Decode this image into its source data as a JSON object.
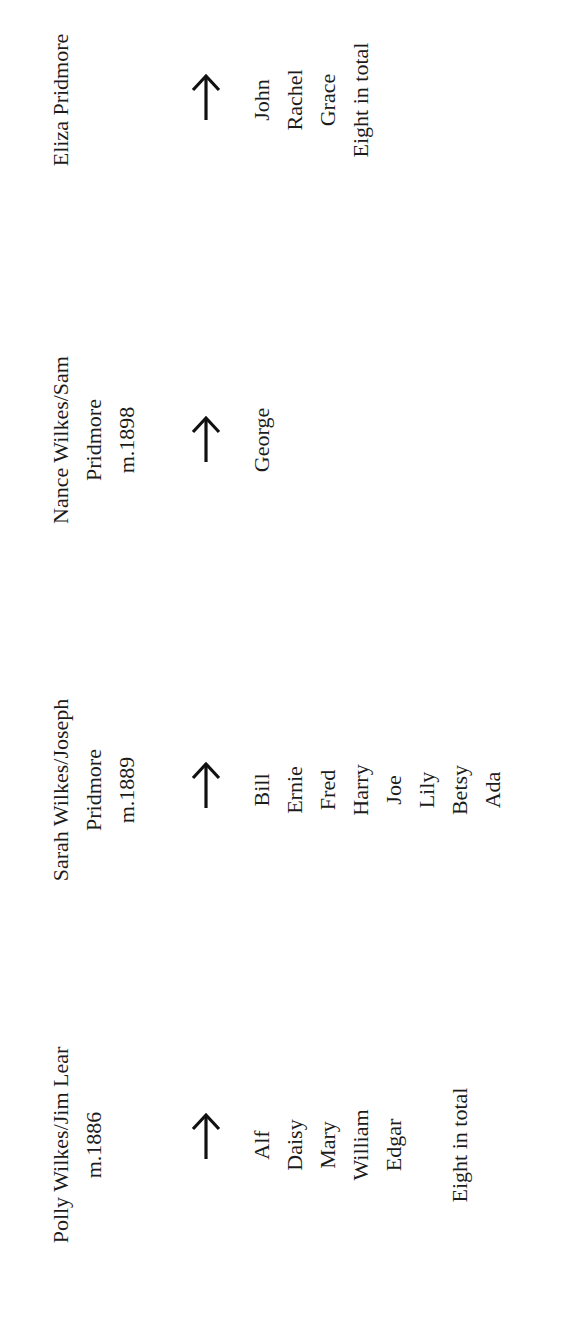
{
  "document": {
    "type": "family-tree",
    "orientation": "rotated-90-ccw",
    "text_color": "#1c1c1c",
    "background": "#ffffff"
  },
  "groups": [
    {
      "id": "polly",
      "header": [
        "Polly Wilkes/Jim Lear",
        "m.1886"
      ],
      "arrow_icon": "right-arrow",
      "children": [
        "Alf",
        "Daisy",
        "Mary",
        "William",
        "Edgar"
      ],
      "total_note": "Eight in total"
    },
    {
      "id": "sarah",
      "header": [
        "Sarah Wilkes/Joseph",
        "Pridmore",
        "m.1889"
      ],
      "arrow_icon": "right-arrow",
      "children": [
        "Bill",
        "Ernie",
        "Fred",
        "Harry",
        "Joe",
        "Lily",
        "Betsy",
        "Ada"
      ],
      "total_note": null
    },
    {
      "id": "nance",
      "header": [
        "Nance Wilkes/Sam",
        "Pridmore",
        "m.1898"
      ],
      "arrow_icon": "right-arrow",
      "children": [
        "George"
      ],
      "total_note": null
    },
    {
      "id": "eliza",
      "header": [
        "Eliza Pridmore"
      ],
      "arrow_icon": "right-arrow",
      "children": [
        "John",
        "Rachel",
        "Grace",
        "Eight in total"
      ],
      "total_note": null
    }
  ]
}
